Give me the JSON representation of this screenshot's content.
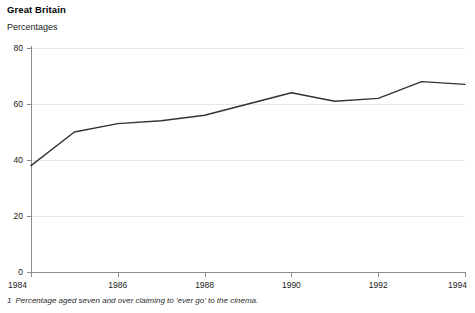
{
  "header": {
    "title": "Great Britain",
    "units_label": "Percentages"
  },
  "footnote": {
    "marker": "1",
    "text": "Percentage aged seven and over claiming to 'ever go' to the cinema."
  },
  "colors": {
    "line": "#333333",
    "axis": "#8c8c8c",
    "grid": "#e6e6e6",
    "text": "#1a1a1a",
    "background": "#ffffff"
  },
  "chart_data": {
    "type": "line",
    "title": "Great Britain",
    "subtitle": "Percentages",
    "xlabel": "",
    "ylabel": "Percentages",
    "x": [
      1984,
      1985,
      1986,
      1987,
      1988,
      1989,
      1990,
      1991,
      1992,
      1993,
      1994
    ],
    "values": [
      38,
      50,
      53,
      54,
      56,
      60,
      64,
      61,
      62,
      68,
      67
    ],
    "series": [
      {
        "name": "Percentage aged seven and over claiming to 'ever go' to the cinema",
        "values": [
          38,
          50,
          53,
          54,
          56,
          60,
          64,
          61,
          62,
          68,
          67
        ]
      }
    ],
    "xlim": [
      1984,
      1994
    ],
    "ylim": [
      0,
      80
    ],
    "ytick_labels": [
      "0",
      "20",
      "40",
      "60",
      "80"
    ],
    "yticks": [
      0,
      20,
      40,
      60,
      80
    ],
    "xtick_labels": [
      "1984",
      "1986",
      "1988",
      "1990",
      "1992",
      "1994"
    ],
    "xticks": [
      1984,
      1986,
      1988,
      1990,
      1992,
      1994
    ],
    "grid": true,
    "grid_axis": "y",
    "legend": false,
    "legend_position": "none"
  }
}
